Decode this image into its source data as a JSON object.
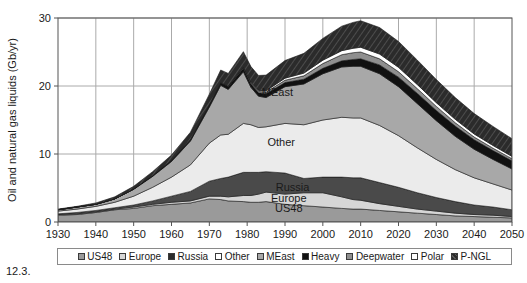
{
  "caption": "12.3.",
  "chart_data": {
    "type": "area",
    "title": "",
    "xlabel": "",
    "ylabel": "Oil and natural gas liquids (Gb/yr)",
    "xlim": [
      1930,
      2050
    ],
    "ylim": [
      0,
      30
    ],
    "xticks": [
      1930,
      1940,
      1950,
      1960,
      1970,
      1980,
      1990,
      2000,
      2010,
      2020,
      2030,
      2040,
      2050
    ],
    "yticks": [
      0,
      10,
      20,
      30
    ],
    "grid": true,
    "legend_position": "below",
    "stacked": true,
    "x": [
      1930,
      1935,
      1940,
      1945,
      1950,
      1955,
      1960,
      1965,
      1970,
      1973,
      1975,
      1979,
      1981,
      1983,
      1985,
      1990,
      1995,
      2000,
      2005,
      2008,
      2010,
      2015,
      2020,
      2025,
      2030,
      2035,
      2040,
      2045,
      2050
    ],
    "series": [
      {
        "name": "US48",
        "color": "#9a9a9a",
        "values": [
          1.0,
          1.1,
          1.4,
          1.8,
          2.0,
          2.4,
          2.6,
          2.8,
          3.4,
          3.3,
          3.1,
          3.0,
          2.9,
          2.9,
          3.0,
          2.6,
          2.4,
          2.2,
          2.0,
          1.9,
          1.9,
          1.7,
          1.5,
          1.3,
          1.1,
          0.9,
          0.8,
          0.7,
          0.6
        ]
      },
      {
        "name": "Europe",
        "color": "#d6d6d6",
        "values": [
          0.1,
          0.1,
          0.1,
          0.1,
          0.2,
          0.2,
          0.3,
          0.3,
          0.4,
          0.5,
          0.6,
          0.9,
          1.0,
          1.2,
          1.4,
          1.5,
          1.9,
          2.1,
          1.7,
          1.4,
          1.3,
          1.0,
          0.8,
          0.6,
          0.5,
          0.4,
          0.3,
          0.3,
          0.2
        ]
      },
      {
        "name": "Russia",
        "color": "#4a4a4a",
        "values": [
          0.1,
          0.2,
          0.2,
          0.2,
          0.3,
          0.5,
          0.9,
          1.4,
          2.2,
          2.6,
          2.9,
          3.4,
          3.4,
          3.2,
          3.0,
          3.1,
          2.1,
          2.3,
          2.9,
          3.2,
          3.3,
          3.1,
          2.8,
          2.4,
          2.0,
          1.7,
          1.4,
          1.2,
          1.0
        ]
      },
      {
        "name": "Other",
        "color": "#ebebeb",
        "values": [
          0.4,
          0.5,
          0.6,
          0.8,
          1.3,
          2.0,
          2.8,
          3.9,
          5.6,
          6.4,
          6.3,
          7.2,
          7.0,
          6.6,
          6.6,
          7.3,
          7.9,
          8.4,
          8.8,
          8.8,
          8.8,
          8.4,
          7.6,
          6.6,
          5.6,
          4.7,
          4.0,
          3.4,
          2.9
        ]
      },
      {
        "name": "MEast",
        "color": "#a8a8a8",
        "values": [
          0.2,
          0.3,
          0.3,
          0.5,
          1.0,
          1.6,
          2.3,
          3.5,
          5.3,
          7.3,
          6.6,
          7.6,
          5.5,
          4.6,
          4.3,
          5.4,
          6.0,
          6.8,
          7.4,
          7.6,
          7.6,
          7.6,
          7.2,
          6.5,
          5.7,
          4.9,
          4.2,
          3.6,
          3.1
        ]
      },
      {
        "name": "Heavy",
        "color": "#111111",
        "values": [
          0.0,
          0.0,
          0.0,
          0.0,
          0.05,
          0.1,
          0.15,
          0.2,
          0.3,
          0.35,
          0.4,
          0.5,
          0.5,
          0.5,
          0.55,
          0.6,
          0.7,
          0.8,
          0.9,
          1.0,
          1.1,
          1.3,
          1.4,
          1.5,
          1.5,
          1.5,
          1.4,
          1.3,
          1.2
        ]
      },
      {
        "name": "Deepwater",
        "color": "#8f8f8f",
        "values": [
          0.0,
          0.0,
          0.0,
          0.0,
          0.0,
          0.0,
          0.0,
          0.0,
          0.0,
          0.0,
          0.05,
          0.1,
          0.15,
          0.2,
          0.25,
          0.35,
          0.5,
          0.7,
          0.9,
          1.0,
          1.0,
          0.9,
          0.8,
          0.7,
          0.6,
          0.5,
          0.4,
          0.35,
          0.3
        ]
      },
      {
        "name": "Polar",
        "color": "#ffffff",
        "values": [
          0.0,
          0.0,
          0.0,
          0.0,
          0.0,
          0.0,
          0.0,
          0.0,
          0.0,
          0.0,
          0.0,
          0.05,
          0.1,
          0.15,
          0.2,
          0.3,
          0.4,
          0.5,
          0.6,
          0.65,
          0.7,
          0.7,
          0.65,
          0.6,
          0.55,
          0.5,
          0.45,
          0.4,
          0.35
        ]
      },
      {
        "name": "P-NGL",
        "color": "#2b2b2b",
        "hatch": true,
        "values": [
          0.1,
          0.1,
          0.2,
          0.3,
          0.4,
          0.6,
          0.8,
          1.1,
          1.6,
          1.9,
          1.9,
          2.3,
          2.3,
          2.2,
          2.3,
          2.6,
          2.9,
          3.2,
          3.6,
          3.8,
          3.9,
          3.9,
          3.8,
          3.6,
          3.4,
          3.2,
          3.0,
          2.8,
          2.6
        ]
      }
    ],
    "annotations": [
      {
        "text": "MEast",
        "x": 1988,
        "y": 18.5
      },
      {
        "text": "Other",
        "x": 1989,
        "y": 11.2
      },
      {
        "text": "Russia",
        "x": 1992,
        "y": 4.6
      },
      {
        "text": "Europe",
        "x": 1991,
        "y": 2.9
      },
      {
        "text": "US48",
        "x": 1991,
        "y": 1.5
      }
    ]
  },
  "legend": {
    "items": [
      {
        "label": "US48",
        "color": "#9a9a9a"
      },
      {
        "label": "Europe",
        "color": "#d6d6d6"
      },
      {
        "label": "Russia",
        "color": "#2b2b2b"
      },
      {
        "label": "Other",
        "color": "#ffffff"
      },
      {
        "label": "MEast",
        "color": "#a8a8a8"
      },
      {
        "label": "Heavy",
        "color": "#111111"
      },
      {
        "label": "Deepwater",
        "color": "#8f8f8f"
      },
      {
        "label": "Polar",
        "color": "#ffffff"
      },
      {
        "label": "P-NGL",
        "color": "#2b2b2b"
      }
    ]
  }
}
